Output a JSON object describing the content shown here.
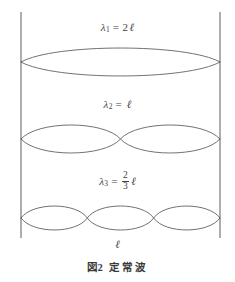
{
  "figure": {
    "caption_prefix": "図",
    "caption_number": "2",
    "caption_text": "定常波",
    "background_color": "#ffffff",
    "line_color": "#595959",
    "wall_color": "#6b6b6b"
  },
  "boundary": {
    "left_wall_name": "left-boundary-wall",
    "right_wall_name": "right-boundary-wall",
    "left_x": 21,
    "right_x": 220,
    "top_y": 12,
    "bottom_y": 248
  },
  "dimension": {
    "label": "ℓ",
    "arrow_y": 246,
    "arrow_style": "double-headed"
  },
  "waves": [
    {
      "id": "wave-1",
      "symbol": "λ",
      "subscript": "1",
      "equals": "=",
      "coefficient": "2",
      "unit": "ℓ",
      "label_plain": "λ₁ = 2ℓ",
      "harmonic": 1,
      "lobes": 1,
      "axis_y": 62,
      "amplitude": 14
    },
    {
      "id": "wave-2",
      "symbol": "λ",
      "subscript": "2",
      "equals": "=",
      "coefficient": "",
      "unit": "ℓ",
      "label_plain": "λ₂ = ℓ",
      "harmonic": 2,
      "lobes": 2,
      "axis_y": 139,
      "amplitude": 14
    },
    {
      "id": "wave-3",
      "symbol": "λ",
      "subscript": "3",
      "equals": "=",
      "fraction_numerator": "2",
      "fraction_denominator": "3",
      "unit": "ℓ",
      "label_plain": "λ₃ = (2/3)ℓ",
      "harmonic": 3,
      "lobes": 3,
      "axis_y": 218,
      "amplitude": 12
    }
  ]
}
